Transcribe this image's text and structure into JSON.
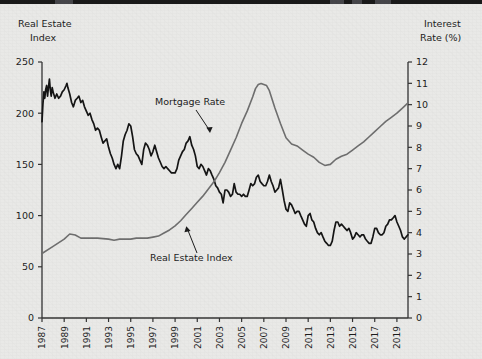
{
  "figure": {
    "background_color": "#e9e9e7",
    "top_band_color": "#1a1a1a"
  },
  "axes": {
    "left": {
      "title_line1": "Real Estate",
      "title_line2": "Index",
      "ticks": [
        "0",
        "50",
        "100",
        "150",
        "200",
        "250"
      ],
      "min": 0,
      "max": 250
    },
    "right": {
      "title_line1": "Interest",
      "title_line2": "Rate (%)",
      "ticks": [
        "0",
        "1",
        "2",
        "3",
        "4",
        "5",
        "6",
        "7",
        "8",
        "9",
        "10",
        "11",
        "12"
      ],
      "min": 0,
      "max": 12
    },
    "bottom": {
      "ticks": [
        "1987",
        "1989",
        "1991",
        "1993",
        "1995",
        "1997",
        "1999",
        "2001",
        "2003",
        "2005",
        "2007",
        "2009",
        "2011",
        "2013",
        "2015",
        "2017",
        "2019"
      ],
      "min": 1987,
      "max": 2020
    }
  },
  "annotations": [
    {
      "label": "Mortgage Rate",
      "target_series": "mortgage_rate"
    },
    {
      "label": "Real Estate Index",
      "target_series": "real_estate_index"
    }
  ],
  "chart_data": {
    "type": "line",
    "title": "",
    "xlabel": "",
    "ylabel": "Real Estate Index",
    "y2label": "Interest Rate (%)",
    "xlim": [
      1987,
      2020
    ],
    "ylim": [
      0,
      250
    ],
    "y2lim": [
      0,
      12
    ],
    "grid": false,
    "legend": "annotations",
    "series": [
      {
        "name": "Mortgage Rate",
        "axis": "right",
        "color": "#151515",
        "unit": "%",
        "x": [
          1987.0,
          1987.08,
          1987.17,
          1987.25,
          1987.33,
          1987.42,
          1987.5,
          1987.58,
          1987.67,
          1987.75,
          1987.83,
          1987.92,
          1988.0,
          1988.17,
          1988.33,
          1988.5,
          1988.67,
          1988.83,
          1989.0,
          1989.17,
          1989.25,
          1989.33,
          1989.5,
          1989.67,
          1989.83,
          1990.0,
          1990.17,
          1990.33,
          1990.5,
          1990.67,
          1990.83,
          1991.0,
          1991.17,
          1991.33,
          1991.5,
          1991.67,
          1991.83,
          1992.0,
          1992.17,
          1992.33,
          1992.5,
          1992.67,
          1992.83,
          1993.0,
          1993.17,
          1993.33,
          1993.5,
          1993.67,
          1993.83,
          1994.0,
          1994.17,
          1994.33,
          1994.5,
          1994.67,
          1994.83,
          1995.0,
          1995.17,
          1995.33,
          1995.5,
          1995.67,
          1995.83,
          1996.0,
          1996.17,
          1996.33,
          1996.5,
          1996.67,
          1996.83,
          1997.0,
          1997.17,
          1997.33,
          1997.5,
          1997.67,
          1997.83,
          1998.0,
          1998.17,
          1998.33,
          1998.5,
          1998.67,
          1998.83,
          1999.0,
          1999.17,
          1999.33,
          1999.5,
          1999.67,
          1999.83,
          2000.0,
          2000.17,
          2000.33,
          2000.5,
          2000.67,
          2000.83,
          2001.0,
          2001.17,
          2001.33,
          2001.5,
          2001.67,
          2001.83,
          2002.0,
          2002.17,
          2002.33,
          2002.5,
          2002.67,
          2002.83,
          2003.0,
          2003.17,
          2003.33,
          2003.5,
          2003.67,
          2003.83,
          2004.0,
          2004.17,
          2004.33,
          2004.5,
          2004.67,
          2004.83,
          2005.0,
          2005.17,
          2005.33,
          2005.5,
          2005.67,
          2005.83,
          2006.0,
          2006.17,
          2006.33,
          2006.5,
          2006.67,
          2006.83,
          2007.0,
          2007.17,
          2007.33,
          2007.5,
          2007.67,
          2007.83,
          2008.0,
          2008.17,
          2008.33,
          2008.5,
          2008.67,
          2008.83,
          2009.0,
          2009.17,
          2009.33,
          2009.5,
          2009.67,
          2009.83,
          2010.0,
          2010.17,
          2010.33,
          2010.5,
          2010.67,
          2010.83,
          2011.0,
          2011.17,
          2011.33,
          2011.5,
          2011.67,
          2011.83,
          2012.0,
          2012.17,
          2012.33,
          2012.5,
          2012.67,
          2012.83,
          2013.0,
          2013.17,
          2013.33,
          2013.5,
          2013.67,
          2013.83,
          2014.0,
          2014.17,
          2014.33,
          2014.5,
          2014.67,
          2014.83,
          2015.0,
          2015.17,
          2015.33,
          2015.5,
          2015.67,
          2015.83,
          2016.0,
          2016.17,
          2016.33,
          2016.5,
          2016.67,
          2016.83,
          2017.0,
          2017.17,
          2017.33,
          2017.5,
          2017.67,
          2017.83,
          2018.0,
          2018.17,
          2018.33,
          2018.5,
          2018.67,
          2018.83,
          2019.0,
          2019.17,
          2019.33,
          2019.5,
          2019.67,
          2019.83,
          2020.0
        ],
        "values": [
          9.2,
          10.0,
          10.6,
          10.3,
          10.7,
          10.9,
          10.4,
          10.8,
          11.2,
          10.7,
          10.4,
          10.8,
          10.6,
          10.3,
          10.5,
          10.3,
          10.4,
          10.6,
          10.7,
          10.9,
          11.0,
          10.8,
          10.5,
          10.1,
          9.9,
          10.2,
          10.3,
          10.4,
          10.1,
          10.2,
          9.9,
          9.7,
          9.5,
          9.6,
          9.3,
          9.1,
          8.8,
          8.9,
          8.8,
          8.5,
          8.2,
          8.3,
          8.4,
          8.0,
          7.7,
          7.5,
          7.2,
          7.0,
          7.2,
          7.0,
          7.6,
          8.3,
          8.6,
          8.8,
          9.1,
          9.0,
          8.5,
          7.9,
          7.7,
          7.6,
          7.4,
          7.2,
          7.9,
          8.2,
          8.1,
          7.9,
          7.6,
          7.8,
          8.1,
          7.8,
          7.5,
          7.3,
          7.1,
          7.0,
          7.1,
          7.0,
          6.9,
          6.8,
          6.8,
          6.8,
          7.0,
          7.4,
          7.6,
          7.8,
          7.9,
          8.2,
          8.3,
          8.5,
          8.1,
          7.9,
          7.6,
          7.1,
          7.0,
          7.2,
          7.1,
          6.9,
          6.7,
          7.0,
          6.9,
          6.7,
          6.5,
          6.2,
          6.1,
          5.9,
          5.8,
          5.4,
          6.0,
          6.0,
          5.9,
          5.7,
          5.8,
          6.3,
          5.9,
          5.8,
          5.8,
          5.7,
          5.8,
          5.7,
          5.7,
          6.0,
          6.3,
          6.2,
          6.3,
          6.6,
          6.7,
          6.4,
          6.3,
          6.2,
          6.2,
          6.4,
          6.7,
          6.4,
          6.2,
          5.9,
          6.0,
          6.1,
          6.5,
          6.0,
          5.5,
          5.1,
          5.0,
          5.4,
          5.3,
          5.1,
          4.9,
          5.0,
          5.0,
          4.8,
          4.6,
          4.4,
          4.3,
          4.8,
          4.9,
          4.6,
          4.5,
          4.2,
          4.0,
          3.9,
          4.0,
          3.8,
          3.6,
          3.5,
          3.4,
          3.4,
          3.6,
          4.1,
          4.5,
          4.5,
          4.3,
          4.4,
          4.3,
          4.2,
          4.1,
          4.2,
          4.0,
          3.7,
          3.8,
          4.0,
          3.9,
          3.8,
          3.9,
          3.9,
          3.7,
          3.6,
          3.5,
          3.5,
          3.8,
          4.2,
          4.2,
          4.0,
          3.9,
          3.9,
          4.0,
          4.3,
          4.4,
          4.6,
          4.6,
          4.7,
          4.8,
          4.5,
          4.3,
          4.1,
          3.8,
          3.7,
          3.8,
          3.9
        ]
      },
      {
        "name": "Real Estate Index",
        "axis": "left",
        "color": "#6f6f6f",
        "unit": "index",
        "x": [
          1987,
          1988,
          1989,
          1989.5,
          1990,
          1990.5,
          1991,
          1991.5,
          1992,
          1993,
          1993.5,
          1994,
          1994.5,
          1995,
          1995.5,
          1996,
          1996.5,
          1997,
          1997.5,
          1998,
          1998.5,
          1999,
          1999.5,
          2000,
          2000.5,
          2001,
          2001.5,
          2002,
          2002.5,
          2003,
          2003.5,
          2004,
          2004.5,
          2005,
          2005.5,
          2006,
          2006.25,
          2006.5,
          2006.75,
          2007,
          2007.25,
          2007.5,
          2008,
          2008.5,
          2009,
          2009.5,
          2010,
          2010.5,
          2011,
          2011.5,
          2012,
          2012.5,
          2013,
          2013.5,
          2014,
          2014.5,
          2015,
          2015.5,
          2016,
          2016.5,
          2017,
          2017.5,
          2018,
          2018.5,
          2019,
          2019.5,
          2020
        ],
        "values": [
          63,
          70,
          77,
          82,
          81,
          78,
          78,
          78,
          78,
          77,
          76,
          77,
          77,
          77,
          78,
          78,
          78,
          79,
          80,
          83,
          86,
          90,
          95,
          101,
          107,
          113,
          119,
          126,
          133,
          142,
          152,
          164,
          176,
          190,
          202,
          216,
          224,
          228,
          229,
          228,
          227,
          222,
          205,
          190,
          176,
          170,
          168,
          164,
          160,
          157,
          152,
          149,
          150,
          155,
          158,
          160,
          164,
          168,
          172,
          177,
          182,
          187,
          192,
          196,
          200,
          205,
          210
        ]
      }
    ]
  }
}
